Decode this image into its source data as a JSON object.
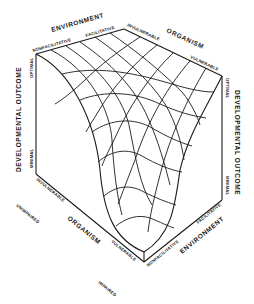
{
  "figure": {
    "type": "3D surface diagram",
    "axes": {
      "environment": {
        "title": "ENVIRONMENT",
        "ticks": [
          "NONFACILITATIVE",
          "FACILITATIVE"
        ]
      },
      "organism": {
        "title": "ORGANISM",
        "ticks": [
          "INVULNERABLE",
          "VULNERABLE"
        ],
        "outer_ticks": [
          "UNIMPAIRED",
          "IMPAIRED"
        ]
      },
      "outcome_left": {
        "title": "DEVELOPMENTAL OUTCOME",
        "ticks": [
          "OPTIMAL",
          "MINIMAL"
        ]
      },
      "outcome_right": {
        "title": "DEVELOPMENTAL OUTCOME",
        "ticks": [
          "OPTIMAL",
          "MINIMAL"
        ]
      }
    },
    "bottom_labels": {
      "organism_title": "ORGANISM",
      "organism_invulnerable": "INVULNERABLE",
      "organism_vulnerable": "VULNERABLE",
      "environment_title": "ENVIRONMENT",
      "environment_nonfacilitative": "NONFACILITATIVE",
      "environment_facilitative": "FACILITATIVE",
      "unimpaired": "UNIMPAIRED",
      "impaired": "IMPAIRED"
    },
    "surface": {
      "shape": "saddle / trough descending to minimal outcome at vulnerable organism + nonfacilitative environment",
      "grid_lines_each_direction": 6
    }
  }
}
